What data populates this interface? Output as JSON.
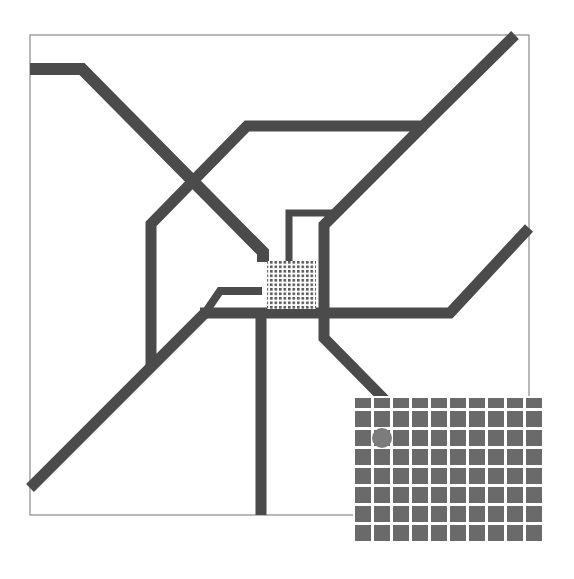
{
  "diagram": {
    "canvas": {
      "width": 574,
      "height": 579,
      "background": "#ffffff"
    },
    "frame": {
      "x": 30,
      "y": 35,
      "width": 499,
      "height": 480,
      "stroke": "#8a8a8a"
    },
    "colors": {
      "track": "#4b4b4b",
      "cell": "#6a6a6a",
      "grid_gap": "#ffffff",
      "hatch_line": "#4b4b4b",
      "marker": "#7c7c7c"
    },
    "tracks": [
      {
        "name": "track-top-left",
        "width": 12,
        "points": [
          [
            30,
            69
          ],
          [
            82,
            69
          ],
          [
            263,
            252
          ],
          [
            263,
            262
          ]
        ]
      },
      {
        "name": "track-upper-loop",
        "width": 11,
        "points": [
          [
            515,
            35
          ],
          [
            423,
            126
          ],
          [
            247,
            126
          ],
          [
            151,
            224
          ],
          [
            151,
            367
          ]
        ]
      },
      {
        "name": "track-lower-left-diagonal",
        "width": 11,
        "points": [
          [
            30,
            488
          ],
          [
            205,
            313
          ]
        ]
      },
      {
        "name": "track-right-inner",
        "width": 11,
        "points": [
          [
            423,
            126
          ],
          [
            324,
            225
          ],
          [
            324,
            338
          ],
          [
            385,
            400
          ]
        ]
      },
      {
        "name": "track-horizontal-bus",
        "width": 11,
        "points": [
          [
            200,
            313
          ],
          [
            450,
            313
          ],
          [
            529,
            228
          ]
        ]
      },
      {
        "name": "track-small-bracket",
        "width": 8,
        "points": [
          [
            205,
            313
          ],
          [
            220,
            291
          ],
          [
            262,
            291
          ]
        ]
      },
      {
        "name": "track-vertical-down",
        "width": 11,
        "points": [
          [
            261,
            313
          ],
          [
            261,
            515
          ]
        ]
      },
      {
        "name": "track-thin-loop",
        "width": 7,
        "points": [
          [
            289,
            262
          ],
          [
            289,
            213
          ],
          [
            331,
            213
          ],
          [
            324,
            225
          ]
        ]
      }
    ],
    "hatched_pad": {
      "x": 267,
      "y": 261,
      "width": 49,
      "height": 48,
      "lines": 11
    },
    "pad_grid": {
      "x": 355,
      "y": 398,
      "columns": 10,
      "rows": 8,
      "cell_width": 16,
      "cell_height": 16,
      "gap": 3,
      "first_row_height": 10
    },
    "marker": {
      "shape": "circle",
      "column": 1,
      "row": 2,
      "radius": 10
    }
  }
}
